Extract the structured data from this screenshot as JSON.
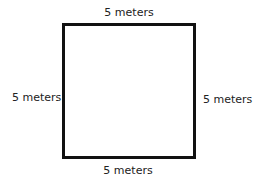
{
  "diagram": {
    "shape": "square",
    "side_length": 5,
    "unit": "meters",
    "labels": {
      "top": "5 meters",
      "left": "5 meters",
      "right": "5 meters",
      "bottom": "5 meters"
    }
  }
}
